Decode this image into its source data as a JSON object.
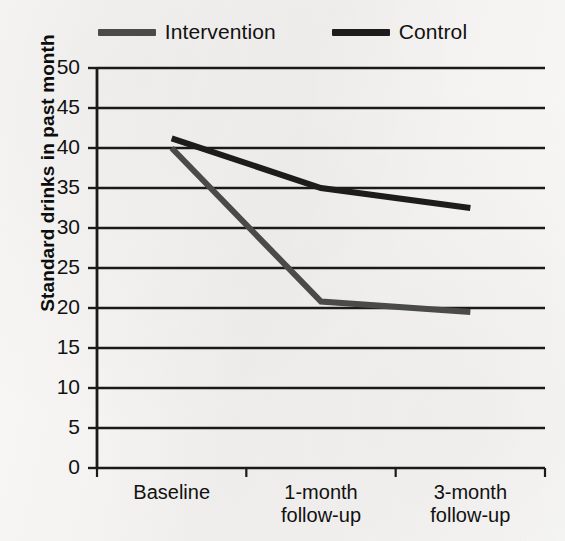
{
  "chart_data": {
    "type": "line",
    "title": "",
    "xlabel": "",
    "ylabel": "Standard drinks in past month",
    "categories": [
      "Baseline",
      "1-month follow-up",
      "3-month follow-up"
    ],
    "category_lines": [
      [
        "Baseline"
      ],
      [
        "1-month",
        "follow-up"
      ],
      [
        "3-month",
        "follow-up"
      ]
    ],
    "ylim": [
      0,
      50
    ],
    "ytick_step": 5,
    "ytick_labels": [
      "50",
      "45",
      "40",
      "35",
      "30",
      "25",
      "20",
      "15",
      "10",
      "5",
      "0"
    ],
    "ytick_values": [
      50,
      45,
      40,
      35,
      30,
      25,
      20,
      15,
      10,
      5,
      0
    ],
    "grid": true,
    "grid_axis": "y",
    "legend_position": "top-center",
    "series": [
      {
        "name": "Intervention",
        "color": "#4a4a4a",
        "values": [
          40.0,
          20.8,
          19.5
        ]
      },
      {
        "name": "Control",
        "color": "#1c1c1c",
        "values": [
          41.2,
          35.0,
          32.5
        ]
      }
    ]
  },
  "legend": {
    "entries": [
      {
        "label": "Intervention",
        "swatch": "line-swatch-intervention"
      },
      {
        "label": "Control",
        "swatch": "line-swatch-control"
      }
    ]
  },
  "axes": {
    "y_title": "Standard drinks in past month"
  },
  "colors": {
    "background": "#f2f1ef",
    "axis": "#1a1a1a",
    "gridline": "#1a1a1a",
    "intervention": "#4a4a4a",
    "control": "#1c1c1c",
    "text": "#111111"
  }
}
